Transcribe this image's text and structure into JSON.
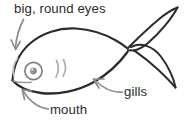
{
  "diagram": {
    "style": "hand-drawn line sketch",
    "background_color": "#ffffff",
    "ink_color": "#2b2b2b",
    "light_ink_color": "#b3b3b3",
    "arrow_color": "#8c8c8c"
  },
  "labels": {
    "eyes": {
      "text": "big, round eyes",
      "target": "eye",
      "arrow_direction": "down-left"
    },
    "gills": {
      "text": "gills",
      "target": "gill-line",
      "arrow_direction": "up-left"
    },
    "mouth": {
      "text": "mouth",
      "target": "mouth",
      "arrow_direction": "up-left"
    }
  },
  "parts": {
    "body": "fish-body-outline",
    "tail": "forked-tail-fin",
    "eye_outer": "eye-outer-ring",
    "eye_pupil": "eye-pupil",
    "gill_marks": "gill-slit-marks",
    "gill_cover": "gill-cover-curve",
    "mouth_line": "mouth-line"
  }
}
